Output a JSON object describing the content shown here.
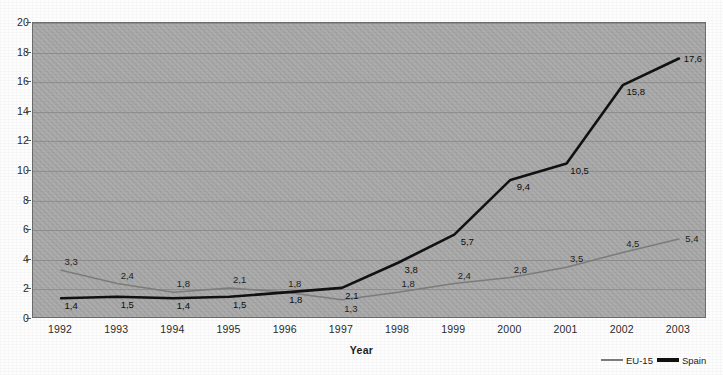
{
  "chart_data": {
    "type": "line",
    "title": "",
    "xlabel": "Year",
    "ylabel": "",
    "categories": [
      "1992",
      "1993",
      "1994",
      "1995",
      "1996",
      "1997",
      "1998",
      "1999",
      "2000",
      "2001",
      "2002",
      "2003"
    ],
    "series": [
      {
        "name": "EU-15",
        "color": "#7d7d7d",
        "values": [
          3.3,
          2.4,
          1.8,
          2.1,
          1.8,
          1.3,
          1.8,
          2.4,
          2.8,
          3.5,
          4.5,
          5.4
        ],
        "labels": [
          "3,3",
          "2,4",
          "1,8",
          "2,1",
          "1,8",
          "1,3",
          "1,8",
          "2,4",
          "2,8",
          "3,5",
          "4,5",
          "5,4"
        ]
      },
      {
        "name": "Spain",
        "color": "#111111",
        "values": [
          1.4,
          1.5,
          1.4,
          1.5,
          1.8,
          2.1,
          3.8,
          5.7,
          9.4,
          10.5,
          15.8,
          17.6
        ],
        "labels": [
          "1,4",
          "1,5",
          "1,4",
          "1,5",
          "1,8",
          "2,1",
          "3,8",
          "5,7",
          "9,4",
          "10,5",
          "15,8",
          "17,6"
        ]
      }
    ],
    "ylim": [
      0,
      20
    ],
    "ytick_step": 2,
    "yticks": [
      "0",
      "2",
      "4",
      "6",
      "8",
      "10",
      "12",
      "14",
      "16",
      "18",
      "20"
    ],
    "grid": true,
    "legend_position": "bottom-right",
    "plot_background": "#a9a9a9"
  },
  "legend": {
    "items": [
      {
        "label": "EU-15"
      },
      {
        "label": "Spain"
      }
    ]
  },
  "axis": {
    "x_title": "Year"
  }
}
